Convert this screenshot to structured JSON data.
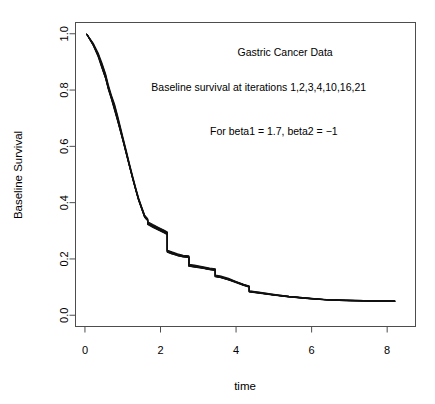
{
  "chart_data": {
    "type": "line",
    "title": "",
    "xlabel": "time",
    "ylabel": "Baseline Survival",
    "xlim": [
      -0.25,
      8.75
    ],
    "ylim": [
      -0.04,
      1.04
    ],
    "grid": false,
    "legend": "none",
    "xticks": [
      0,
      2,
      4,
      6,
      8
    ],
    "xtick_labels": [
      "0",
      "2",
      "4",
      "6",
      "8"
    ],
    "yticks": [
      0.0,
      0.2,
      0.4,
      0.6,
      0.8,
      1.0
    ],
    "ytick_labels": [
      "0.0",
      "0.2",
      "0.4",
      "0.6",
      "0.8",
      "1.0"
    ],
    "annotations": [
      {
        "text": "Gastric Cancer Data",
        "x": 5.3,
        "y": 0.935
      },
      {
        "text": "Baseline survival at iterations 1,2,3,4,10,16,21",
        "x": 4.6,
        "y": 0.81
      },
      {
        "text": "For beta1 = 1.7, beta2 = −1",
        "x": 5.0,
        "y": 0.655
      }
    ],
    "series": [
      {
        "name": "iteration 1",
        "x": [
          0.05,
          0.22,
          0.35,
          0.45,
          0.55,
          0.62,
          0.7,
          0.78,
          0.86,
          0.94,
          1.02,
          1.1,
          1.18,
          1.26,
          1.34,
          1.42,
          1.5,
          1.58,
          1.62,
          1.66,
          1.66,
          1.8,
          1.95,
          2.1,
          2.18,
          2.18,
          2.3,
          2.45,
          2.6,
          2.75,
          2.75,
          2.9,
          3.1,
          3.3,
          3.45,
          3.45,
          3.6,
          3.8,
          4.0,
          4.2,
          4.35,
          4.35,
          4.6,
          5.0,
          5.4,
          5.9,
          6.4,
          6.9,
          7.4,
          7.8,
          8.2
        ],
        "y": [
          0.998,
          0.962,
          0.925,
          0.888,
          0.848,
          0.812,
          0.775,
          0.742,
          0.702,
          0.66,
          0.618,
          0.575,
          0.532,
          0.49,
          0.45,
          0.412,
          0.382,
          0.352,
          0.345,
          0.34,
          0.328,
          0.318,
          0.308,
          0.298,
          0.292,
          0.228,
          0.222,
          0.215,
          0.21,
          0.208,
          0.178,
          0.175,
          0.17,
          0.165,
          0.162,
          0.14,
          0.136,
          0.128,
          0.118,
          0.108,
          0.102,
          0.085,
          0.08,
          0.072,
          0.066,
          0.06,
          0.055,
          0.053,
          0.052,
          0.051,
          0.05
        ]
      },
      {
        "name": "iteration 2",
        "x": [
          0.05,
          0.22,
          0.35,
          0.45,
          0.55,
          0.62,
          0.7,
          0.78,
          0.86,
          0.94,
          1.02,
          1.1,
          1.18,
          1.26,
          1.34,
          1.42,
          1.5,
          1.58,
          1.62,
          1.66,
          1.66,
          1.8,
          1.95,
          2.1,
          2.18,
          2.18,
          2.3,
          2.45,
          2.6,
          2.75,
          2.75,
          2.9,
          3.1,
          3.3,
          3.45,
          3.45,
          3.6,
          3.8,
          4.0,
          4.2,
          4.35,
          4.35,
          4.6,
          5.0,
          5.4,
          5.9,
          6.4,
          6.9,
          7.4,
          7.8,
          8.2
        ],
        "y": [
          0.998,
          0.958,
          0.918,
          0.878,
          0.84,
          0.802,
          0.768,
          0.73,
          0.692,
          0.652,
          0.612,
          0.57,
          0.528,
          0.486,
          0.446,
          0.408,
          0.378,
          0.348,
          0.342,
          0.336,
          0.322,
          0.312,
          0.302,
          0.292,
          0.286,
          0.224,
          0.218,
          0.212,
          0.207,
          0.205,
          0.174,
          0.171,
          0.167,
          0.162,
          0.159,
          0.137,
          0.133,
          0.125,
          0.116,
          0.106,
          0.1,
          0.083,
          0.078,
          0.071,
          0.065,
          0.059,
          0.054,
          0.052,
          0.051,
          0.05,
          0.05
        ]
      },
      {
        "name": "iteration 3",
        "x": [
          0.05,
          0.22,
          0.35,
          0.45,
          0.55,
          0.62,
          0.7,
          0.78,
          0.86,
          0.94,
          1.02,
          1.1,
          1.18,
          1.26,
          1.34,
          1.42,
          1.5,
          1.58,
          1.62,
          1.66,
          1.66,
          1.8,
          1.95,
          2.1,
          2.18,
          2.18,
          2.3,
          2.45,
          2.6,
          2.75,
          2.75,
          2.9,
          3.1,
          3.3,
          3.45,
          3.45,
          3.6,
          3.8,
          4.0,
          4.2,
          4.35,
          4.35,
          4.6,
          5.0,
          5.4,
          5.9,
          6.4,
          6.9,
          7.4,
          7.8,
          8.2
        ],
        "y": [
          0.998,
          0.966,
          0.932,
          0.896,
          0.856,
          0.818,
          0.782,
          0.752,
          0.712,
          0.668,
          0.625,
          0.582,
          0.538,
          0.496,
          0.455,
          0.417,
          0.386,
          0.356,
          0.349,
          0.343,
          0.332,
          0.322,
          0.312,
          0.302,
          0.296,
          0.231,
          0.225,
          0.218,
          0.213,
          0.211,
          0.181,
          0.178,
          0.173,
          0.168,
          0.165,
          0.143,
          0.139,
          0.131,
          0.12,
          0.11,
          0.104,
          0.087,
          0.082,
          0.074,
          0.067,
          0.061,
          0.056,
          0.054,
          0.052,
          0.051,
          0.05
        ]
      },
      {
        "name": "iteration 4",
        "x": [
          0.05,
          0.22,
          0.35,
          0.45,
          0.55,
          0.62,
          0.7,
          0.78,
          0.86,
          0.94,
          1.02,
          1.1,
          1.18,
          1.26,
          1.34,
          1.42,
          1.5,
          1.58,
          1.62,
          1.66,
          1.66,
          1.8,
          1.95,
          2.1,
          2.18,
          2.18,
          2.3,
          2.45,
          2.6,
          2.75,
          2.75,
          2.9,
          3.1,
          3.3,
          3.45,
          3.45,
          3.6,
          3.8,
          4.0,
          4.2,
          4.35,
          4.35,
          4.6,
          5.0,
          5.4,
          5.9,
          6.4,
          6.9,
          7.4,
          7.8,
          8.2
        ],
        "y": [
          0.998,
          0.96,
          0.928,
          0.882,
          0.842,
          0.806,
          0.772,
          0.735,
          0.696,
          0.656,
          0.614,
          0.572,
          0.53,
          0.488,
          0.448,
          0.41,
          0.38,
          0.35,
          0.343,
          0.338,
          0.325,
          0.315,
          0.305,
          0.295,
          0.289,
          0.226,
          0.22,
          0.213,
          0.208,
          0.206,
          0.176,
          0.173,
          0.168,
          0.163,
          0.16,
          0.138,
          0.134,
          0.126,
          0.117,
          0.107,
          0.101,
          0.084,
          0.079,
          0.072,
          0.066,
          0.06,
          0.055,
          0.053,
          0.051,
          0.05,
          0.05
        ]
      },
      {
        "name": "iteration 10",
        "x": [
          0.05,
          0.22,
          0.35,
          0.45,
          0.55,
          0.62,
          0.7,
          0.78,
          0.86,
          0.94,
          1.02,
          1.1,
          1.18,
          1.26,
          1.34,
          1.42,
          1.5,
          1.58,
          1.62,
          1.66,
          1.66,
          1.8,
          1.95,
          2.1,
          2.18,
          2.18,
          2.3,
          2.45,
          2.6,
          2.75,
          2.75,
          2.9,
          3.1,
          3.3,
          3.45,
          3.45,
          3.6,
          3.8,
          4.0,
          4.2,
          4.35,
          4.35,
          4.6,
          5.0,
          5.4,
          5.9,
          6.4,
          6.9,
          7.4,
          7.8,
          8.2
        ],
        "y": [
          0.998,
          0.964,
          0.922,
          0.892,
          0.852,
          0.81,
          0.778,
          0.746,
          0.706,
          0.663,
          0.62,
          0.578,
          0.534,
          0.492,
          0.452,
          0.414,
          0.384,
          0.354,
          0.347,
          0.341,
          0.33,
          0.32,
          0.31,
          0.3,
          0.294,
          0.23,
          0.224,
          0.216,
          0.211,
          0.209,
          0.179,
          0.176,
          0.171,
          0.166,
          0.163,
          0.141,
          0.137,
          0.129,
          0.119,
          0.109,
          0.103,
          0.086,
          0.081,
          0.073,
          0.067,
          0.061,
          0.055,
          0.053,
          0.052,
          0.051,
          0.05
        ]
      },
      {
        "name": "iteration 16",
        "x": [
          0.05,
          0.22,
          0.35,
          0.45,
          0.55,
          0.62,
          0.7,
          0.78,
          0.86,
          0.94,
          1.02,
          1.1,
          1.18,
          1.26,
          1.34,
          1.42,
          1.5,
          1.58,
          1.62,
          1.66,
          1.66,
          1.8,
          1.95,
          2.1,
          2.18,
          2.18,
          2.3,
          2.45,
          2.6,
          2.75,
          2.75,
          2.9,
          3.1,
          3.3,
          3.45,
          3.45,
          3.6,
          3.8,
          4.0,
          4.2,
          4.35,
          4.35,
          4.6,
          5.0,
          5.4,
          5.9,
          6.4,
          6.9,
          7.4,
          7.8,
          8.2
        ],
        "y": [
          0.998,
          0.961,
          0.926,
          0.885,
          0.845,
          0.808,
          0.774,
          0.738,
          0.699,
          0.658,
          0.616,
          0.574,
          0.531,
          0.489,
          0.449,
          0.411,
          0.381,
          0.351,
          0.344,
          0.339,
          0.326,
          0.316,
          0.306,
          0.296,
          0.29,
          0.227,
          0.221,
          0.214,
          0.209,
          0.207,
          0.177,
          0.174,
          0.169,
          0.164,
          0.161,
          0.139,
          0.135,
          0.127,
          0.118,
          0.108,
          0.102,
          0.085,
          0.08,
          0.072,
          0.066,
          0.06,
          0.055,
          0.053,
          0.051,
          0.05,
          0.05
        ]
      },
      {
        "name": "iteration 21",
        "x": [
          0.05,
          0.22,
          0.35,
          0.45,
          0.55,
          0.62,
          0.7,
          0.78,
          0.86,
          0.94,
          1.02,
          1.1,
          1.18,
          1.26,
          1.34,
          1.42,
          1.5,
          1.58,
          1.62,
          1.66,
          1.66,
          1.8,
          1.95,
          2.1,
          2.18,
          2.18,
          2.3,
          2.45,
          2.6,
          2.75,
          2.75,
          2.9,
          3.1,
          3.3,
          3.45,
          3.45,
          3.6,
          3.8,
          4.0,
          4.2,
          4.35,
          4.35,
          4.6,
          5.0,
          5.4,
          5.9,
          6.4,
          6.9,
          7.4,
          7.8,
          8.2
        ],
        "y": [
          0.998,
          0.959,
          0.921,
          0.88,
          0.841,
          0.804,
          0.77,
          0.733,
          0.694,
          0.654,
          0.613,
          0.571,
          0.529,
          0.487,
          0.447,
          0.409,
          0.379,
          0.349,
          0.342,
          0.337,
          0.324,
          0.314,
          0.304,
          0.294,
          0.288,
          0.225,
          0.219,
          0.212,
          0.208,
          0.206,
          0.175,
          0.172,
          0.168,
          0.163,
          0.16,
          0.138,
          0.134,
          0.126,
          0.117,
          0.107,
          0.101,
          0.084,
          0.079,
          0.072,
          0.065,
          0.06,
          0.054,
          0.052,
          0.051,
          0.05,
          0.05
        ]
      }
    ]
  },
  "style": {
    "line_color": "#111111",
    "frame_color": "#4d4d4d",
    "background": "#ffffff"
  }
}
